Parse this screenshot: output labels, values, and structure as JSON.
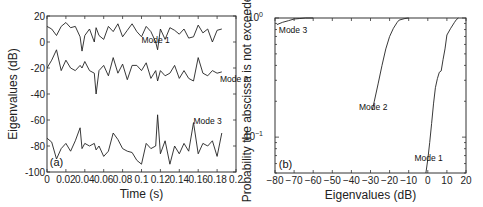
{
  "chart_data": [
    {
      "panel": "(a)",
      "type": "line",
      "title": "",
      "xlabel": "Time (s)",
      "ylabel": "Eigenvalues (dB)",
      "xlim": [
        0,
        0.2
      ],
      "ylim": [
        -100,
        20
      ],
      "xticks": [
        0,
        0.02,
        0.04,
        0.06,
        0.08,
        0.1,
        0.12,
        0.14,
        0.16,
        0.18,
        0.2
      ],
      "xtick_labels": [
        "0",
        "0.02",
        "0.04",
        "0.06",
        "0.08",
        "0.1",
        "0.12",
        "0.14",
        "0.16",
        "0.18",
        "0.2"
      ],
      "yticks": [
        -100,
        -80,
        -60,
        -40,
        -20,
        0,
        20
      ],
      "ytick_labels": [
        "-100",
        "-80",
        "-60",
        "-40",
        "-20",
        "0",
        "20"
      ],
      "grid": false,
      "legend": "none (inline annotations)",
      "annotations": [
        {
          "text": "Mode 1",
          "x": 0.1,
          "y": -1
        },
        {
          "text": "Mode 2",
          "x": 0.183,
          "y": -31
        },
        {
          "text": "Mode 3",
          "x": 0.155,
          "y": -63
        },
        {
          "text": "(a)",
          "x": 0.003,
          "y": -95
        }
      ],
      "x": [
        0,
        0.005,
        0.01,
        0.015,
        0.02,
        0.025,
        0.03,
        0.035,
        0.037,
        0.04,
        0.045,
        0.05,
        0.052,
        0.055,
        0.06,
        0.065,
        0.07,
        0.075,
        0.08,
        0.085,
        0.09,
        0.095,
        0.1,
        0.105,
        0.11,
        0.115,
        0.117,
        0.12,
        0.125,
        0.13,
        0.135,
        0.14,
        0.145,
        0.15,
        0.155,
        0.16,
        0.165,
        0.17,
        0.175,
        0.18,
        0.185
      ],
      "series": [
        {
          "name": "Mode 1",
          "values": [
            12,
            10,
            5,
            12,
            15,
            11,
            12,
            4,
            -7,
            5,
            10,
            0,
            11,
            5,
            2,
            12,
            8,
            14,
            4,
            9,
            14,
            8,
            4,
            12,
            8,
            0,
            -6,
            10,
            2,
            11,
            9,
            6,
            10,
            3,
            4,
            13,
            7,
            10,
            0,
            9,
            10
          ]
        },
        {
          "name": "Mode 2",
          "values": [
            -20,
            -14,
            -6,
            -22,
            -14,
            -20,
            -22,
            -18,
            -20,
            -15,
            -22,
            -24,
            -40,
            -22,
            -18,
            -26,
            -12,
            -24,
            -17,
            -29,
            -18,
            -18,
            -22,
            -16,
            -28,
            -22,
            -30,
            -22,
            -26,
            -24,
            -18,
            -28,
            -22,
            -28,
            -30,
            -12,
            -24,
            -26,
            -22,
            -24,
            -23
          ]
        },
        {
          "name": "Mode 3",
          "values": [
            -74,
            -77,
            -90,
            -82,
            -78,
            -84,
            -76,
            -66,
            -82,
            -78,
            -80,
            -78,
            -83,
            -80,
            -88,
            -84,
            -70,
            -75,
            -82,
            -84,
            -85,
            -91,
            -94,
            -78,
            -82,
            -80,
            -56,
            -86,
            -76,
            -94,
            -80,
            -86,
            -78,
            -84,
            -62,
            -86,
            -78,
            -80,
            -76,
            -88,
            -70
          ]
        }
      ]
    },
    {
      "panel": "(b)",
      "type": "line",
      "title": "",
      "xlabel": "Eigenvalues (dB)",
      "ylabel": "Probability the abscissa is not exceeded",
      "xlim": [
        -80,
        20
      ],
      "ylim": [
        0.05,
        1
      ],
      "yscale": "log",
      "xticks": [
        -80,
        -70,
        -60,
        -50,
        -40,
        -30,
        -20,
        -10,
        0,
        10,
        20
      ],
      "xtick_labels": [
        "-80",
        "-70",
        "-60",
        "-50",
        "-40",
        "-30",
        "-20",
        "-10",
        "0",
        "10",
        "20"
      ],
      "yticks": [
        0.1,
        1
      ],
      "ytick_labels": [
        "10^-1",
        "10^0"
      ],
      "grid": false,
      "legend": "none (inline annotations)",
      "annotations": [
        {
          "text": "Mode 3",
          "x": -78,
          "y": 0.75
        },
        {
          "text": "Mode 2",
          "x": -36,
          "y": 0.17
        },
        {
          "text": "Mode 1",
          "x": -7,
          "y": 0.063
        },
        {
          "text": "(b)",
          "x": -78,
          "y": 0.055
        }
      ],
      "series": [
        {
          "name": "Mode 1",
          "x": [
            -1,
            0,
            1,
            2,
            3,
            4,
            5,
            6,
            7,
            8,
            9,
            10,
            12,
            14,
            15,
            16
          ],
          "values": [
            0.05,
            0.065,
            0.09,
            0.13,
            0.19,
            0.26,
            0.31,
            0.35,
            0.36,
            0.45,
            0.55,
            0.72,
            0.82,
            0.92,
            0.97,
            1.0
          ]
        },
        {
          "name": "Mode 2",
          "x": [
            -29,
            -28,
            -26,
            -24,
            -22,
            -20,
            -18,
            -16,
            -15,
            -12,
            -10
          ],
          "values": [
            0.17,
            0.2,
            0.28,
            0.4,
            0.55,
            0.7,
            0.82,
            0.92,
            0.96,
            0.99,
            1.0
          ]
        },
        {
          "name": "Mode 3",
          "x": [
            -79,
            -76,
            -73,
            -70,
            -67,
            -64,
            -60
          ],
          "values": [
            0.88,
            0.92,
            0.95,
            0.98,
            0.99,
            1.0,
            1.0
          ]
        }
      ]
    }
  ]
}
